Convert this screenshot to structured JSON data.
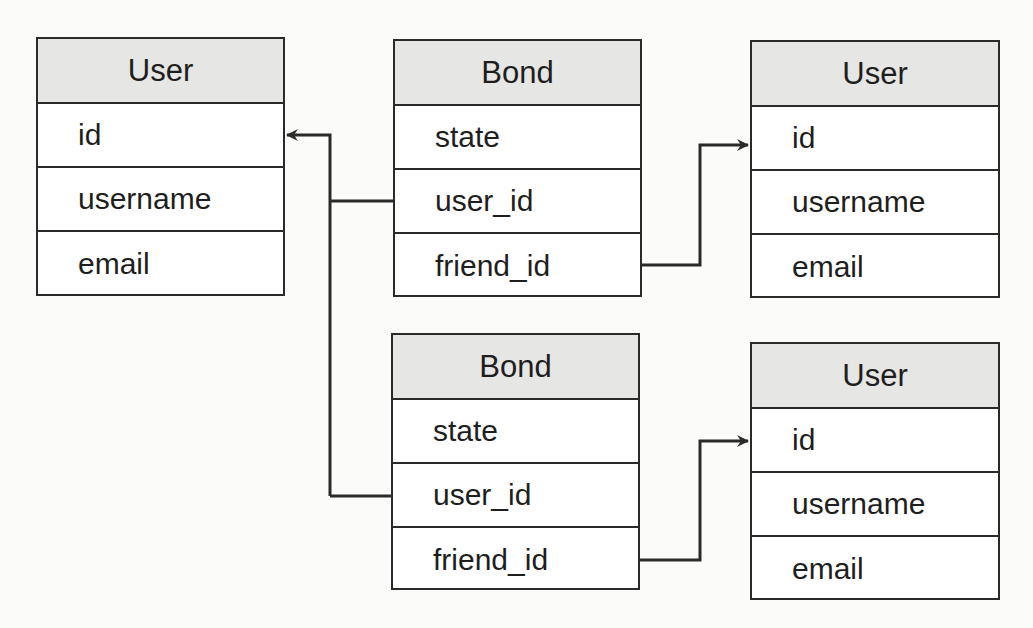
{
  "diagram": {
    "type": "entity-relationship",
    "entities": [
      {
        "id": "user_left",
        "title": "User",
        "fields": [
          "id",
          "username",
          "email"
        ]
      },
      {
        "id": "bond_top",
        "title": "Bond",
        "fields": [
          "state",
          "user_id",
          "friend_id"
        ]
      },
      {
        "id": "user_right_top",
        "title": "User",
        "fields": [
          "id",
          "username",
          "email"
        ]
      },
      {
        "id": "bond_bottom",
        "title": "Bond",
        "fields": [
          "state",
          "user_id",
          "friend_id"
        ]
      },
      {
        "id": "user_right_bottom",
        "title": "User",
        "fields": [
          "id",
          "username",
          "email"
        ]
      }
    ],
    "relationships": [
      {
        "from": "bond_top.user_id",
        "to": "user_left.id"
      },
      {
        "from": "bond_bottom.user_id",
        "to": "user_left.id"
      },
      {
        "from": "bond_top.friend_id",
        "to": "user_right_top.id"
      },
      {
        "from": "bond_bottom.friend_id",
        "to": "user_right_bottom.id"
      }
    ],
    "colors": {
      "header_fill": "#e6e6e4",
      "line": "#2a2a2a",
      "background": "#fbfbfa"
    }
  }
}
